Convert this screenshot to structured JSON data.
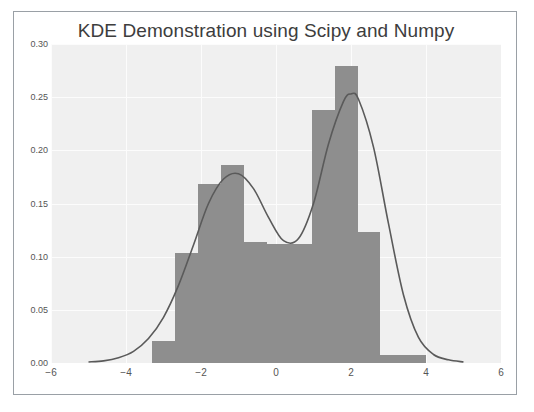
{
  "figure": {
    "title": "KDE Demonstration using Scipy and Numpy",
    "plot_bg_color": "#f0f0f0",
    "bar_color": "#8e8e8e",
    "kde_line_color": "#5a5a5a",
    "grid_color": "#fcfcfc",
    "frame_color": "#9aa0a6"
  },
  "chart_data": {
    "type": "bar",
    "title": "KDE Demonstration using Scipy and Numpy",
    "xlabel": "",
    "ylabel": "",
    "xlim": [
      -6,
      6
    ],
    "ylim": [
      0.0,
      0.3
    ],
    "grid": true,
    "legend": "none",
    "xticks": [
      -6,
      -4,
      -2,
      0,
      2,
      4,
      6
    ],
    "xticklabels": [
      "−6",
      "−4",
      "−2",
      "0",
      "2",
      "4",
      "6"
    ],
    "yticks": [
      0.0,
      0.05,
      0.1,
      0.15,
      0.2,
      0.25,
      0.3
    ],
    "yticklabels": [
      "0.00",
      "0.05",
      "0.10",
      "0.15",
      "0.20",
      "0.25",
      "0.30"
    ],
    "histogram": {
      "name": "Histogram (density)",
      "bin_edges": [
        -3.3,
        -2.69,
        -2.08,
        -1.47,
        -0.86,
        -0.25,
        0.36,
        0.97,
        1.58,
        2.19,
        2.78,
        3.39,
        4.0
      ],
      "values": [
        0.021,
        0.103,
        0.168,
        0.186,
        0.114,
        0.112,
        0.112,
        0.238,
        0.279,
        0.123,
        0.008,
        0.008
      ]
    },
    "kde_curve": {
      "name": "Gaussian KDE",
      "x": [
        -5.0,
        -4.6,
        -4.2,
        -3.8,
        -3.4,
        -3.0,
        -2.6,
        -2.2,
        -1.8,
        -1.4,
        -1.0,
        -0.6,
        -0.2,
        0.2,
        0.6,
        1.0,
        1.4,
        1.8,
        2.0,
        2.2,
        2.6,
        3.0,
        3.4,
        3.8,
        4.2,
        4.6,
        5.0
      ],
      "y": [
        0.001,
        0.002,
        0.005,
        0.011,
        0.023,
        0.043,
        0.073,
        0.111,
        0.15,
        0.173,
        0.178,
        0.164,
        0.137,
        0.115,
        0.117,
        0.15,
        0.206,
        0.246,
        0.253,
        0.248,
        0.203,
        0.131,
        0.064,
        0.024,
        0.008,
        0.003,
        0.001
      ],
      "peaks": [
        {
          "x": -1.0,
          "y": 0.178
        },
        {
          "x": 2.0,
          "y": 0.253
        }
      ],
      "trough": {
        "x": 0.35,
        "y": 0.114
      }
    }
  }
}
